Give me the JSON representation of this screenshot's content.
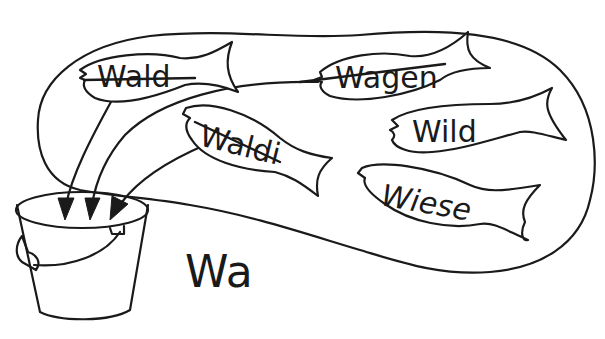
{
  "scene": {
    "description": "Worksheet illustration: fish in a pond, words starting with 'Wa' are crossed out and collected into a bucket",
    "ink_color": "#1a1a1a",
    "background_color": "#ffffff"
  },
  "bucket": {
    "label": "Wa"
  },
  "fish": [
    {
      "id": "wald",
      "word": "Wald",
      "crossed_out": true,
      "arrow_to_bucket": true
    },
    {
      "id": "wagen",
      "word": "Wagen",
      "crossed_out": true,
      "arrow_to_bucket": true
    },
    {
      "id": "waldi",
      "word": "Waldi",
      "crossed_out": true,
      "arrow_to_bucket": true
    },
    {
      "id": "wild",
      "word": "Wild",
      "crossed_out": false,
      "arrow_to_bucket": false
    },
    {
      "id": "wiese",
      "word": "Wiese",
      "crossed_out": false,
      "arrow_to_bucket": false
    }
  ]
}
